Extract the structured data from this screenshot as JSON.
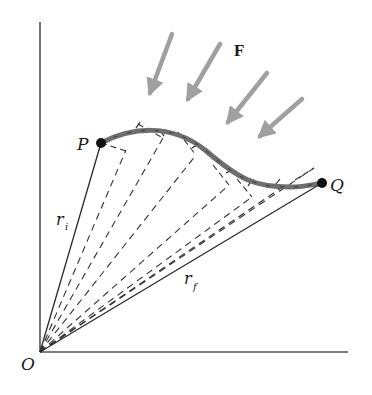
{
  "diagram": {
    "colors": {
      "axis": "#555555",
      "line": "#2a2a2a",
      "dashed": "#333333",
      "path": "#6e6e6e",
      "arrow": "#a0a0a0",
      "point": "#111111"
    },
    "labels": {
      "force": "F",
      "start_point": "P",
      "end_point": "Q",
      "origin": "O",
      "r_initial": "r",
      "r_initial_sub": "i",
      "r_final": "r",
      "r_final_sub": "f"
    },
    "points": {
      "origin": [
        40,
        352
      ],
      "P": [
        101,
        143
      ],
      "Q": [
        322,
        183
      ]
    },
    "force_arrows": [
      {
        "from": [
          172,
          34
        ],
        "to": [
          146,
          103
        ]
      },
      {
        "from": [
          220,
          44
        ],
        "to": [
          183,
          108
        ]
      },
      {
        "from": [
          267,
          73
        ],
        "to": [
          222,
          130
        ]
      },
      {
        "from": [
          302,
          99
        ],
        "to": [
          253,
          143
        ]
      }
    ],
    "radial_dashed_endpoints": [
      [
        126,
        150
      ],
      [
        163,
        138
      ],
      [
        196,
        155
      ],
      [
        229,
        185
      ],
      [
        252,
        197
      ],
      [
        281,
        188
      ],
      [
        314,
        168
      ]
    ]
  }
}
